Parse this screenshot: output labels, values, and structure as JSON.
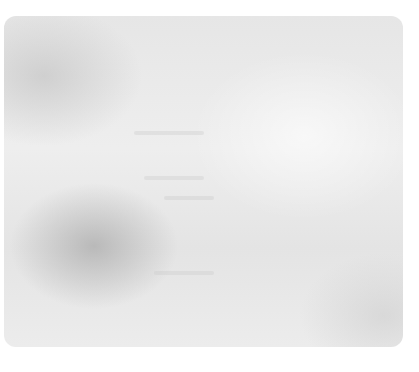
{
  "panel": {
    "background_color": "#e9e9e9",
    "content": ""
  }
}
